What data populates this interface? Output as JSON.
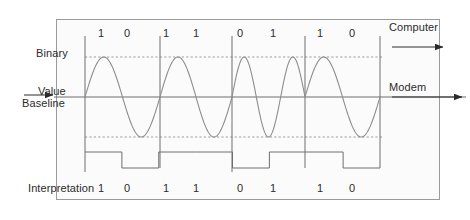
{
  "figure": {
    "title_left_top": "Binary\nValue",
    "baseline_label": "Baseline",
    "interpretation_label": "Interpretation",
    "computer_label": "Computer",
    "modem_label": "Modem"
  },
  "labels": {
    "binary_value_line1": "Binary",
    "binary_value_line2": "Value",
    "baseline": "Baseline",
    "interpretation": "Interpretation",
    "computer": "Computer",
    "modem": "Modem"
  },
  "bits": {
    "top": [
      "1",
      "0",
      "1",
      "1",
      "0",
      "1",
      "1",
      "0"
    ],
    "bottom": [
      "1",
      "0",
      "1",
      "1",
      "0",
      "1",
      "1",
      "0"
    ]
  },
  "colors": {
    "frame_border": "#9a9a9a",
    "frame_fill": "#fbfbfb",
    "wave_stroke": "#8d8d8d",
    "axis_stroke": "#6f6f6f",
    "dashed_stroke": "#9d9d9d",
    "text": "#2b2b2b",
    "page_background": "#ffffff"
  },
  "geometry": {
    "baseline_y": 97,
    "upper_guide_y": 57,
    "lower_guide_y": 137,
    "segment_boundaries_x": [
      85,
      160,
      232,
      305,
      380
    ],
    "bit_label_x": [
      101,
      127,
      166,
      196,
      240,
      273,
      320,
      352
    ],
    "bit_label_top_y": 27,
    "bit_label_bottom_y": 182,
    "square_high_y": 152,
    "square_low_y": 168
  },
  "chart_data": {
    "type": "line",
    "xlabel": "",
    "ylabel": "",
    "categories": [
      "1",
      "0",
      "1",
      "1",
      "0",
      "1",
      "1",
      "0"
    ],
    "series": [
      {
        "name": "Modulated carrier (analog signal)",
        "description": "Sine wave segments, one full cycle per bit pair, amplitude between upper and lower dashed guides"
      },
      {
        "name": "Interpretation (digital square wave)",
        "values": [
          1,
          0,
          1,
          1,
          0,
          1,
          1,
          0
        ]
      }
    ],
    "annotations": [
      "Binary Value",
      "Baseline",
      "Interpretation",
      "Computer",
      "Modem"
    ],
    "grid": false,
    "legend": "none"
  }
}
